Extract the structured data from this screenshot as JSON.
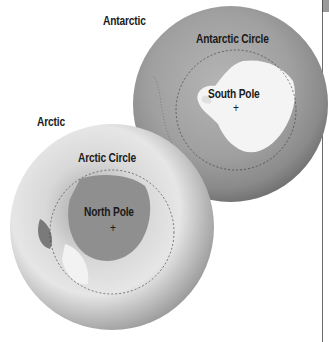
{
  "labels": {
    "antarctic_title": "Antarctic",
    "antarctic_circle": "Antarctic Circle",
    "south_pole": "South Pole",
    "arctic_title": "Arctic",
    "arctic_circle": "Arctic Circle",
    "north_pole": "North Pole"
  },
  "markers": {
    "south_pole": "+",
    "north_pole": "+"
  },
  "colors": {
    "globe_dark": "#3a3a3a",
    "globe_mid": "#8c8c8c",
    "ice": "#f4f4f4",
    "circle_line": "#333333"
  }
}
